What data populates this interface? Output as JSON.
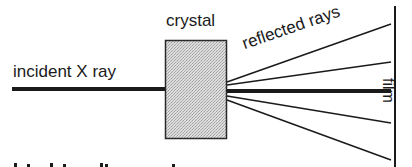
{
  "diagram": {
    "title": "",
    "labels": {
      "incident": "incident X ray",
      "crystal": "crystal",
      "reflected": "reflected rays",
      "film": "film"
    },
    "colors": {
      "ink": "#1a1a1a",
      "crystal_fill": "#d8d8d8",
      "crystal_dot": "#a8a8a8",
      "background": "#ffffff"
    },
    "elements": {
      "incident_ray": {
        "x1": 12,
        "y1": 89,
        "x2": 165,
        "y2": 89,
        "width": 4
      },
      "crystal": {
        "x": 165,
        "y": 40,
        "width": 62,
        "height": 99
      },
      "film": {
        "x": 395,
        "y1": 6,
        "y2": 167,
        "width": 2
      },
      "reflected_rays": [
        {
          "x1": 227,
          "y1": 82,
          "x2": 391,
          "y2": 24,
          "width": 1.5
        },
        {
          "x1": 227,
          "y1": 85,
          "x2": 391,
          "y2": 62,
          "width": 1.5
        },
        {
          "x1": 227,
          "y1": 91,
          "x2": 391,
          "y2": 91,
          "width": 4
        },
        {
          "x1": 227,
          "y1": 96,
          "x2": 391,
          "y2": 123,
          "width": 1.5
        },
        {
          "x1": 227,
          "y1": 100,
          "x2": 391,
          "y2": 160,
          "width": 1.5
        }
      ]
    }
  }
}
